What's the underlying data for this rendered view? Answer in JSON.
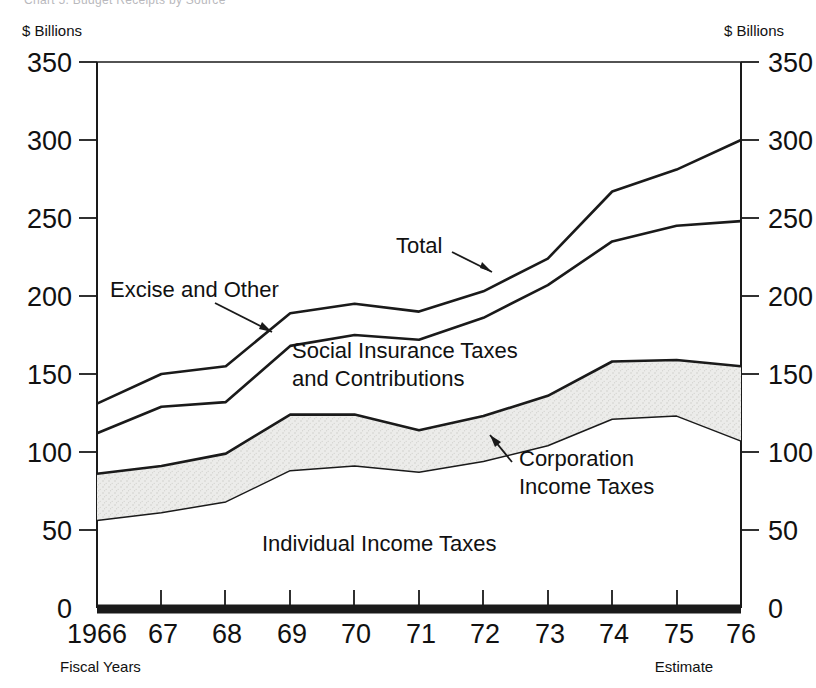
{
  "figure": {
    "cut_caption": "Chart 5. Budget Receipts by Source",
    "unit_label_left": "$ Billions",
    "unit_label_right": "$ Billions",
    "footnote_left": "Fiscal Years",
    "footnote_right": "Estimate"
  },
  "chart_data": {
    "type": "area",
    "title": "",
    "subtitle": "",
    "xlabel": "Fiscal Years",
    "ylabel": "$ Billions",
    "ylim": [
      0,
      350
    ],
    "yticks": [
      0,
      50,
      100,
      150,
      200,
      250,
      300,
      350
    ],
    "ytick_labels": [
      "0",
      "50",
      "100",
      "150",
      "200",
      "250",
      "300",
      "350"
    ],
    "grid": false,
    "legend_position": "inline-annotations",
    "stacked": true,
    "x": [
      1966,
      1967,
      1968,
      1969,
      1970,
      1971,
      1972,
      1973,
      1974,
      1975,
      1976
    ],
    "categories": [
      "1966",
      "67",
      "68",
      "69",
      "70",
      "71",
      "72",
      "73",
      "74",
      "75",
      "76"
    ],
    "xtick_labels": [
      "1966",
      "67",
      "68",
      "69",
      "70",
      "71",
      "72",
      "73",
      "74",
      "75",
      "76"
    ],
    "cumulative_series": [
      {
        "name": "Individual Income Taxes",
        "label": "Individual Income Taxes",
        "cumulative_values": [
          56,
          61,
          68,
          88,
          91,
          87,
          94,
          104,
          121,
          123,
          107
        ]
      },
      {
        "name": "Corporation Income Taxes",
        "label": "Corporation Income Taxes",
        "cumulative_values": [
          86,
          91,
          99,
          124,
          124,
          114,
          123,
          136,
          158,
          159,
          155
        ]
      },
      {
        "name": "Social Insurance Taxes and Contributions",
        "label": "Social Insurance Taxes and Contributions",
        "cumulative_values": [
          112,
          129,
          132,
          168,
          175,
          172,
          186,
          207,
          235,
          245,
          248
        ]
      },
      {
        "name": "Excise and Other",
        "label": "Excise and Other",
        "cumulative_values": [
          131,
          150,
          155,
          189,
          195,
          190,
          203,
          224,
          267,
          281,
          300
        ]
      }
    ],
    "series": [
      {
        "name": "Individual Income Taxes",
        "values": [
          56,
          61,
          68,
          88,
          91,
          87,
          94,
          104,
          121,
          123,
          107
        ]
      },
      {
        "name": "Corporation Income Taxes",
        "values": [
          30,
          30,
          31,
          36,
          33,
          27,
          29,
          32,
          37,
          36,
          48
        ]
      },
      {
        "name": "Social Insurance Taxes and Contributions",
        "values": [
          26,
          38,
          33,
          44,
          51,
          58,
          63,
          71,
          77,
          86,
          93
        ]
      },
      {
        "name": "Excise and Other",
        "values": [
          19,
          21,
          23,
          21,
          20,
          18,
          17,
          17,
          32,
          36,
          52
        ]
      }
    ],
    "total_series": {
      "name": "Total",
      "label": "Total",
      "values": [
        131,
        150,
        155,
        189,
        195,
        190,
        203,
        224,
        267,
        281,
        300
      ]
    },
    "annotations": [
      {
        "text": "Total",
        "target": "total-line"
      },
      {
        "text": "Excise and Other",
        "target": "excise-band"
      },
      {
        "text": "Social Insurance Taxes",
        "target": "social-insurance-band"
      },
      {
        "text": "and Contributions",
        "target": "social-insurance-band"
      },
      {
        "text": "Corporation",
        "target": "corporation-band"
      },
      {
        "text": "Income Taxes",
        "target": "corporation-band"
      },
      {
        "text": "Individual Income Taxes",
        "target": "individual-band"
      }
    ],
    "colors": {
      "line": "#1a1a1a",
      "shaded_band_fill": "#e9e9e7",
      "background": "#ffffff"
    }
  }
}
